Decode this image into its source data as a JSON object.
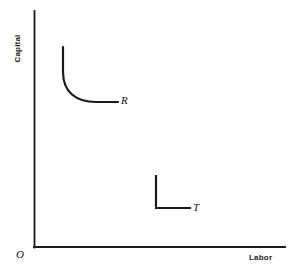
{
  "figure": {
    "background_color": "#ffffff",
    "line_color": "#1a1a1a",
    "width": 289,
    "height": 275
  },
  "axes": {
    "y_axis_label": "Capital",
    "x_axis_label": "Labor",
    "origin_label": "O",
    "x_axis": {
      "x_start": 34,
      "x_end": 285,
      "y": 247
    },
    "y_axis": {
      "x": 34,
      "y_start": 11,
      "y_end": 247
    },
    "grid": "off",
    "tick_labels": []
  },
  "curves": [
    {
      "name": "R",
      "label": "R",
      "type": "smooth-convex-isoquant",
      "description": "Smooth convex isoquant with substitutable inputs",
      "path": "M 63 47 L 63 72 C 63 92 76 102 96 102 L 118 102",
      "label_position": {
        "x": 121,
        "y": 94
      },
      "stroke_width": 2.2
    },
    {
      "name": "T",
      "label": "T",
      "type": "right-angle-isoquant",
      "description": "Right-angle Leontief isoquant with fixed proportions",
      "path": "M 156 176 L 156 208 L 190 208",
      "label_position": {
        "x": 193,
        "y": 201
      },
      "stroke_width": 2.2
    }
  ],
  "chart_data": {
    "type": "line",
    "title": "",
    "xlabel": "Labor",
    "ylabel": "Capital",
    "xlim": [
      0,
      100
    ],
    "ylim": [
      0,
      100
    ],
    "grid": false,
    "legend": "none",
    "annotations": [
      {
        "text": "O",
        "role": "origin-marker",
        "x": 0,
        "y": 0
      },
      {
        "text": "R",
        "role": "curve-label",
        "x": 34,
        "y": 61
      },
      {
        "text": "T",
        "role": "curve-label",
        "x": 63,
        "y": 16
      }
    ],
    "series": [
      {
        "name": "R",
        "shape": "smooth convex isoquant (CES-type, inputs substitutable)",
        "x": [
          11.6,
          11.6,
          11.7,
          12.2,
          13.2,
          15.0,
          17.7,
          21.2,
          24.7,
          28.2,
          31.5,
          33.4
        ],
        "y": [
          84.7,
          78.0,
          73.0,
          68.5,
          65.0,
          62.3,
          61.0,
          61.0,
          61.0,
          61.0,
          61.0,
          61.0
        ]
      },
      {
        "name": "T",
        "shape": "right-angle isoquant (Leontief-type, fixed proportions)",
        "x": [
          48.6,
          48.6,
          48.6,
          62.2
        ],
        "y": [
          30.1,
          22.0,
          16.5,
          16.5
        ]
      }
    ]
  }
}
